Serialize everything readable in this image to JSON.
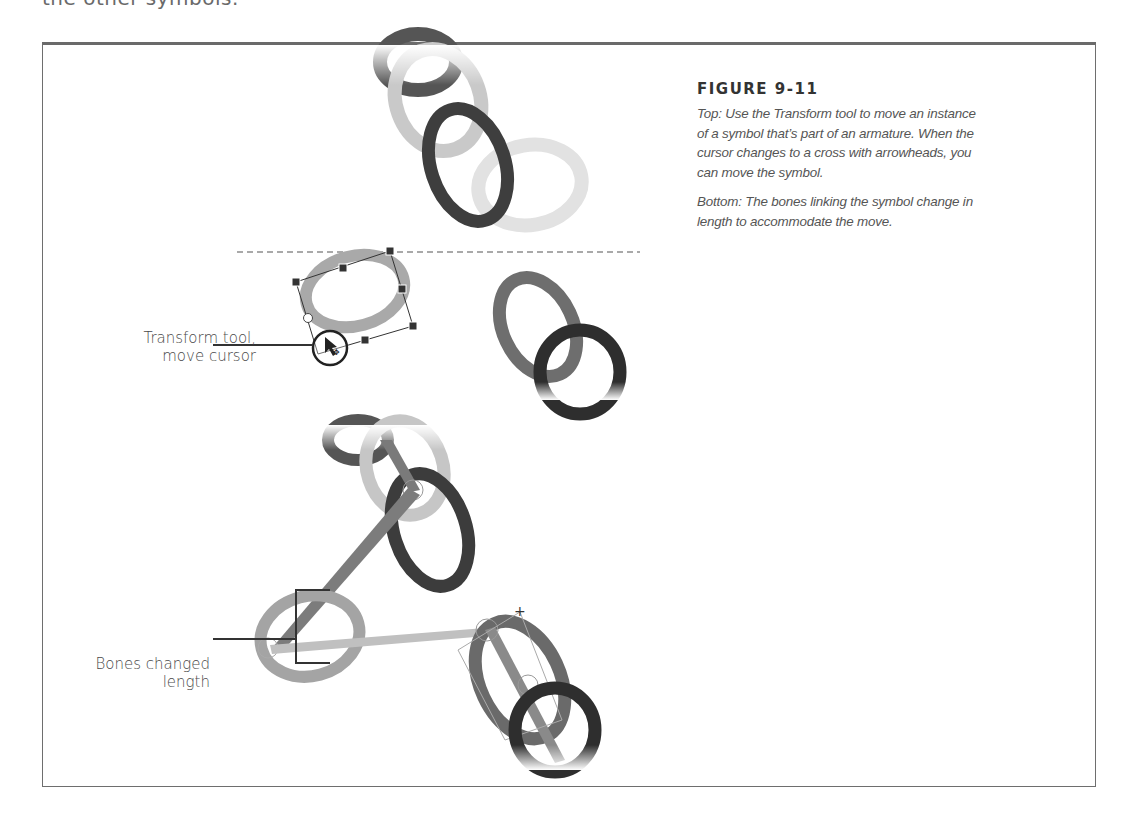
{
  "page": {
    "clipped_heading": "the other symbols."
  },
  "figure": {
    "title": "FIGURE 9-11",
    "caption_top": "Top: Use the Transform tool to move an instance of a symbol that’s part of an armature. When the cursor changes to a cross with arrowheads, you can move the symbol.",
    "caption_bottom": "Bottom: The bones linking the symbol change in length to accommodate the move."
  },
  "callouts": {
    "transform_tool": {
      "line1": "Transform tool,",
      "line2": "move cursor"
    },
    "bones_changed": {
      "line1": "Bones changed",
      "line2": "length"
    }
  },
  "colors": {
    "frame": "#6e6e6e",
    "ring_light": "#c8c8c8",
    "ring_mid": "#8a8a8a",
    "ring_dark": "#3c3c3c",
    "ring_faint": "#e0e0e0",
    "callout_line": "#333333"
  }
}
